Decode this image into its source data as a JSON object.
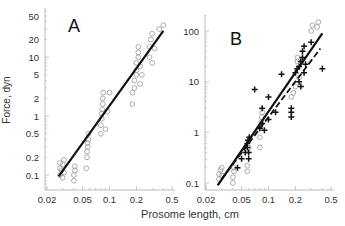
{
  "figure": {
    "ylabel": "Force, dyn",
    "xlabel": "Prosome length, cm",
    "colors": {
      "axis": "#bbbbbb",
      "tick_text": "#444444",
      "line": "#111111",
      "circle": "#999999",
      "cross": "#111111"
    }
  },
  "chart_data": [
    {
      "type": "scatter",
      "panel": "A",
      "title": "A",
      "xscale": "log",
      "yscale": "log",
      "xlabel": "Prosome length, cm",
      "ylabel": "Force, dyn",
      "xlim": [
        0.02,
        0.5
      ],
      "ylim": [
        0.06,
        50
      ],
      "xticks": [
        0.02,
        0.05,
        0.1,
        0.2,
        0.5
      ],
      "xtick_labels": [
        "0.02",
        "0.05",
        "0.1",
        "0.2",
        "0.5"
      ],
      "yticks": [
        0.1,
        0.2,
        0.5,
        1,
        2,
        5,
        10,
        20,
        50
      ],
      "ytick_labels": [
        "0.1",
        "0.2",
        "0.5",
        "1",
        "2",
        "5",
        "10",
        "20",
        "50"
      ],
      "grid": false,
      "series": [
        {
          "name": "observations",
          "marker": "open-circle",
          "points": [
            [
              0.028,
              0.1
            ],
            [
              0.028,
              0.13
            ],
            [
              0.028,
              0.16
            ],
            [
              0.029,
              0.12
            ],
            [
              0.03,
              0.09
            ],
            [
              0.03,
              0.15
            ],
            [
              0.031,
              0.11
            ],
            [
              0.031,
              0.18
            ],
            [
              0.04,
              0.08
            ],
            [
              0.04,
              0.1
            ],
            [
              0.041,
              0.12
            ],
            [
              0.041,
              0.14
            ],
            [
              0.055,
              0.13
            ],
            [
              0.056,
              0.2
            ],
            [
              0.056,
              0.25
            ],
            [
              0.057,
              0.3
            ],
            [
              0.057,
              0.35
            ],
            [
              0.058,
              0.4
            ],
            [
              0.058,
              0.5
            ],
            [
              0.08,
              0.5
            ],
            [
              0.08,
              0.7
            ],
            [
              0.082,
              0.9
            ],
            [
              0.082,
              1.1
            ],
            [
              0.083,
              1.3
            ],
            [
              0.084,
              1.6
            ],
            [
              0.084,
              2
            ],
            [
              0.085,
              2.5
            ],
            [
              0.09,
              0.6
            ],
            [
              0.095,
              1.2
            ],
            [
              0.1,
              2.5
            ],
            [
              0.18,
              1.6
            ],
            [
              0.18,
              2.5
            ],
            [
              0.19,
              3
            ],
            [
              0.19,
              4
            ],
            [
              0.2,
              5
            ],
            [
              0.2,
              6
            ],
            [
              0.2,
              8
            ],
            [
              0.21,
              10
            ],
            [
              0.21,
              12
            ],
            [
              0.21,
              15
            ],
            [
              0.22,
              3.5
            ],
            [
              0.22,
              7
            ],
            [
              0.23,
              5
            ],
            [
              0.28,
              10
            ],
            [
              0.28,
              15
            ],
            [
              0.29,
              20
            ],
            [
              0.3,
              25
            ],
            [
              0.3,
              8
            ],
            [
              0.32,
              14
            ],
            [
              0.36,
              30
            ],
            [
              0.4,
              35
            ]
          ]
        },
        {
          "name": "regression",
          "type": "line",
          "style": "solid",
          "points": [
            [
              0.027,
              0.095
            ],
            [
              0.4,
              28
            ]
          ]
        }
      ]
    },
    {
      "type": "scatter",
      "panel": "B",
      "title": "B",
      "xscale": "log",
      "yscale": "log",
      "xlabel": "Prosome length, cm",
      "ylabel": "",
      "xlim": [
        0.02,
        0.5
      ],
      "ylim": [
        0.07,
        200
      ],
      "xticks": [
        0.02,
        0.05,
        0.1,
        0.2,
        0.5
      ],
      "xtick_labels": [
        "0.02",
        "0.05",
        "0.1",
        "0.2",
        "0.5"
      ],
      "yticks": [
        0.1,
        1,
        10,
        100
      ],
      "ytick_labels": [
        "0.1",
        "1",
        "10",
        "100"
      ],
      "grid": false,
      "series": [
        {
          "name": "circles",
          "marker": "open-circle",
          "points": [
            [
              0.028,
              0.12
            ],
            [
              0.028,
              0.15
            ],
            [
              0.029,
              0.18
            ],
            [
              0.03,
              0.14
            ],
            [
              0.03,
              0.2
            ],
            [
              0.04,
              0.1
            ],
            [
              0.04,
              0.13
            ],
            [
              0.041,
              0.17
            ],
            [
              0.041,
              0.2
            ],
            [
              0.058,
              0.17
            ],
            [
              0.058,
              0.22
            ],
            [
              0.06,
              0.5
            ],
            [
              0.08,
              0.5
            ],
            [
              0.08,
              0.8
            ],
            [
              0.082,
              1.2
            ],
            [
              0.083,
              1.6
            ],
            [
              0.084,
              2
            ],
            [
              0.085,
              2.5
            ],
            [
              0.18,
              5
            ],
            [
              0.19,
              6
            ],
            [
              0.2,
              8
            ],
            [
              0.21,
              25
            ],
            [
              0.21,
              30
            ],
            [
              0.22,
              12
            ],
            [
              0.3,
              100
            ],
            [
              0.31,
              130
            ],
            [
              0.35,
              120
            ],
            [
              0.36,
              150
            ]
          ]
        },
        {
          "name": "crosses",
          "marker": "plus",
          "points": [
            [
              0.045,
              0.2
            ],
            [
              0.05,
              0.3
            ],
            [
              0.055,
              0.4
            ],
            [
              0.058,
              0.5
            ],
            [
              0.058,
              0.6
            ],
            [
              0.059,
              0.7
            ],
            [
              0.06,
              0.3
            ],
            [
              0.06,
              0.4
            ],
            [
              0.061,
              0.8
            ],
            [
              0.08,
              1.2
            ],
            [
              0.085,
              1.5
            ],
            [
              0.09,
              1.1
            ],
            [
              0.1,
              1.8
            ],
            [
              0.12,
              2.5
            ],
            [
              0.07,
              7
            ],
            [
              0.085,
              3
            ],
            [
              0.1,
              5
            ],
            [
              0.14,
              14
            ],
            [
              0.18,
              2
            ],
            [
              0.18,
              2.5
            ],
            [
              0.18,
              3
            ],
            [
              0.2,
              15
            ],
            [
              0.21,
              18
            ],
            [
              0.22,
              20
            ],
            [
              0.22,
              10
            ],
            [
              0.23,
              25
            ],
            [
              0.23,
              8
            ],
            [
              0.24,
              30
            ],
            [
              0.24,
              40
            ],
            [
              0.25,
              15
            ],
            [
              0.25,
              50
            ],
            [
              0.26,
              22
            ],
            [
              0.3,
              60
            ],
            [
              0.4,
              18
            ]
          ]
        },
        {
          "name": "regression-solid",
          "type": "line",
          "style": "solid",
          "points": [
            [
              0.027,
              0.09
            ],
            [
              0.4,
              90
            ]
          ]
        },
        {
          "name": "regression-dashed",
          "type": "line",
          "style": "dashed",
          "points": [
            [
              0.03,
              0.12
            ],
            [
              0.38,
              45
            ]
          ]
        }
      ]
    }
  ]
}
